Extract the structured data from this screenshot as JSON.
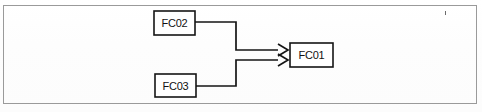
{
  "figure": {
    "kind": "block-diagram",
    "frame_border_color": "#9a9a9a",
    "background_color": "#fefefe",
    "line_color": "#141414",
    "text_color": "#111111"
  },
  "nodes": [
    {
      "id": "fc02",
      "label": "FC02",
      "x": 154,
      "y": 11,
      "w": 41,
      "h": 24
    },
    {
      "id": "fc03",
      "label": "FC03",
      "x": 155,
      "y": 74,
      "w": 41,
      "h": 23
    },
    {
      "id": "fc01",
      "label": "FC01",
      "x": 290,
      "y": 43,
      "w": 43,
      "h": 24
    }
  ],
  "connections": [
    {
      "id": "fc02-to-fc01",
      "from": "FC02",
      "to": "FC01",
      "arrowhead": "chevron"
    },
    {
      "id": "fc03-to-fc01",
      "from": "FC03",
      "to": "FC01",
      "arrowhead": "chevron"
    }
  ],
  "artifacts": [
    {
      "id": "speck-top-right",
      "x": 445,
      "y": 11,
      "w": 1,
      "h": 4
    }
  ]
}
